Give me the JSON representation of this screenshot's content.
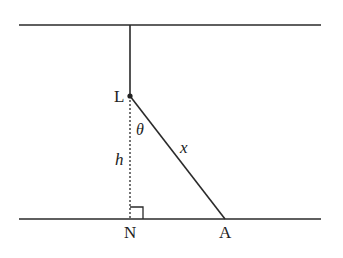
{
  "diagram": {
    "labels": {
      "L": "L",
      "N": "N",
      "A": "A",
      "theta": "θ",
      "x": "x",
      "h": "h"
    },
    "colors": {
      "line": "#2a2a2a",
      "background": "#ffffff"
    }
  }
}
